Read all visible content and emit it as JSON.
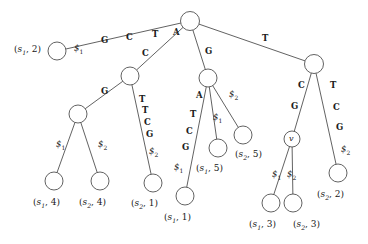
{
  "figure": {
    "type": "generalized-suffix-tree-diagram",
    "width": 368,
    "height": 244,
    "background": "#ffffff",
    "ink_color": "#3a3a3a",
    "text_color": "#202020"
  },
  "nodes": [
    {
      "id": "root",
      "name": "root-node",
      "cx": 190,
      "cy": 21,
      "r": 9.5,
      "label": ""
    },
    {
      "id": "n_s12",
      "name": "leaf-s1-2",
      "cx": 57,
      "cy": 51,
      "r": 9.0,
      "label": ""
    },
    {
      "id": "n_C",
      "name": "internal-node-c",
      "cx": 130,
      "cy": 76,
      "r": 9.0,
      "label": ""
    },
    {
      "id": "n_G",
      "name": "internal-node-g",
      "cx": 208,
      "cy": 78,
      "r": 9.0,
      "label": ""
    },
    {
      "id": "n_T",
      "name": "internal-node-t",
      "cx": 314,
      "cy": 64,
      "r": 9.5,
      "label": ""
    },
    {
      "id": "n_GG",
      "name": "internal-node-gg",
      "cx": 78,
      "cy": 114,
      "r": 9.0,
      "label": ""
    },
    {
      "id": "n_v",
      "name": "internal-node-v",
      "cx": 292,
      "cy": 139,
      "r": 8.0,
      "label": "v"
    },
    {
      "id": "l_s14",
      "name": "leaf-s1-4",
      "cx": 54,
      "cy": 181,
      "r": 9.0,
      "label": ""
    },
    {
      "id": "l_s24",
      "name": "leaf-s2-4",
      "cx": 100,
      "cy": 181,
      "r": 9.0,
      "label": ""
    },
    {
      "id": "l_s21",
      "name": "leaf-s2-1",
      "cx": 153,
      "cy": 183,
      "r": 9.0,
      "label": ""
    },
    {
      "id": "l_s11",
      "name": "leaf-s1-1",
      "cx": 185,
      "cy": 196,
      "r": 9.0,
      "label": ""
    },
    {
      "id": "l_s15",
      "name": "leaf-s1-5",
      "cx": 218,
      "cy": 148,
      "r": 9.0,
      "label": ""
    },
    {
      "id": "l_s25",
      "name": "leaf-s2-5",
      "cx": 243,
      "cy": 135,
      "r": 9.0,
      "label": ""
    },
    {
      "id": "l_s13",
      "name": "leaf-s1-3",
      "cx": 271,
      "cy": 203,
      "r": 9.0,
      "label": ""
    },
    {
      "id": "l_s23",
      "name": "leaf-s2-3",
      "cx": 293,
      "cy": 203,
      "r": 9.0,
      "label": ""
    },
    {
      "id": "l_s22",
      "name": "leaf-s2-2",
      "cx": 338,
      "cy": 173,
      "r": 9.0,
      "label": ""
    }
  ],
  "edges": [
    {
      "id": "e1",
      "name": "edge-root-to-s1-2",
      "from": "root",
      "to": "n_s12",
      "string": "$1 G C T A"
    },
    {
      "id": "e2",
      "name": "edge-root-to-c",
      "from": "root",
      "to": "n_C",
      "string": "C"
    },
    {
      "id": "e3",
      "name": "edge-root-to-g",
      "from": "root",
      "to": "n_G",
      "string": "G"
    },
    {
      "id": "e4",
      "name": "edge-root-to-t",
      "from": "root",
      "to": "n_T",
      "string": "T"
    },
    {
      "id": "e5",
      "name": "edge-c-to-gg",
      "from": "n_C",
      "to": "n_GG",
      "string": "G"
    },
    {
      "id": "e6",
      "name": "edge-c-to-s2-1",
      "from": "n_C",
      "to": "l_s21",
      "string": "T T C G $2"
    },
    {
      "id": "e7",
      "name": "edge-gg-to-s1-4",
      "from": "n_GG",
      "to": "l_s14",
      "string": "$1"
    },
    {
      "id": "e8",
      "name": "edge-gg-to-s2-4",
      "from": "n_GG",
      "to": "l_s24",
      "string": "$2"
    },
    {
      "id": "e9",
      "name": "edge-g-to-s1-1",
      "from": "n_G",
      "to": "l_s11",
      "string": "A T C G $1"
    },
    {
      "id": "e10",
      "name": "edge-g-to-s1-5",
      "from": "n_G",
      "to": "l_s15",
      "string": "$1"
    },
    {
      "id": "e11",
      "name": "edge-g-to-s2-5",
      "from": "n_G",
      "to": "l_s25",
      "string": "$2"
    },
    {
      "id": "e12",
      "name": "edge-t-to-v",
      "from": "n_T",
      "to": "n_v",
      "string": "C G"
    },
    {
      "id": "e13",
      "name": "edge-t-to-s2-2",
      "from": "n_T",
      "to": "l_s22",
      "string": "T C G $2"
    },
    {
      "id": "e14",
      "name": "edge-v-to-s1-3",
      "from": "n_v",
      "to": "l_s13",
      "string": "$1"
    },
    {
      "id": "e15",
      "name": "edge-v-to-s2-3",
      "from": "n_v",
      "to": "l_s23",
      "string": "$2"
    }
  ],
  "edge_labels": [
    {
      "name": "edge-label-dollar1-root-s12",
      "kind": "term",
      "text": "$",
      "subscript": "1",
      "x": 74,
      "y": 44
    },
    {
      "name": "edge-label-g-root-s12",
      "kind": "char",
      "text": "G",
      "x": 101,
      "y": 36
    },
    {
      "name": "edge-label-c-root-s12",
      "kind": "char",
      "text": "C",
      "x": 126,
      "y": 33
    },
    {
      "name": "edge-label-t-root-s12",
      "kind": "char",
      "text": "T",
      "x": 152,
      "y": 30
    },
    {
      "name": "edge-label-a-root-s12",
      "kind": "char",
      "text": "A",
      "x": 173,
      "y": 28
    },
    {
      "name": "edge-label-c-root-c",
      "kind": "char",
      "text": "C",
      "x": 142,
      "y": 49
    },
    {
      "name": "edge-label-g-root-g",
      "kind": "char",
      "text": "G",
      "x": 205,
      "y": 47
    },
    {
      "name": "edge-label-t-root-t",
      "kind": "char",
      "text": "T",
      "x": 262,
      "y": 34
    },
    {
      "name": "edge-label-g-c-gg",
      "kind": "char",
      "text": "G",
      "x": 101,
      "y": 87
    },
    {
      "name": "edge-label-t1-c-s21",
      "kind": "char",
      "text": "T",
      "x": 139,
      "y": 95
    },
    {
      "name": "edge-label-t2-c-s21",
      "kind": "char",
      "text": "T",
      "x": 142,
      "y": 106
    },
    {
      "name": "edge-label-c-c-s21",
      "kind": "char",
      "text": "C",
      "x": 144,
      "y": 118
    },
    {
      "name": "edge-label-g-c-s21",
      "kind": "char",
      "text": "G",
      "x": 146,
      "y": 130
    },
    {
      "name": "edge-label-dollar2-c-s21",
      "kind": "term",
      "text": "$",
      "subscript": "2",
      "x": 149,
      "y": 147
    },
    {
      "name": "edge-label-dollar1-gg-s14",
      "kind": "term",
      "text": "$",
      "subscript": "1",
      "x": 56,
      "y": 140
    },
    {
      "name": "edge-label-dollar2-gg-s24",
      "kind": "term",
      "text": "$",
      "subscript": "2",
      "x": 98,
      "y": 140
    },
    {
      "name": "edge-label-a-g-s11",
      "kind": "char",
      "text": "A",
      "x": 196,
      "y": 91
    },
    {
      "name": "edge-label-t-g-s11",
      "kind": "char",
      "text": "T",
      "x": 190,
      "y": 110
    },
    {
      "name": "edge-label-c-g-s11",
      "kind": "char",
      "text": "C",
      "x": 186,
      "y": 127
    },
    {
      "name": "edge-label-g-g-s11",
      "kind": "char",
      "text": "G",
      "x": 182,
      "y": 143
    },
    {
      "name": "edge-label-dollar1-g-s11",
      "kind": "term",
      "text": "$",
      "subscript": "1",
      "x": 174,
      "y": 163
    },
    {
      "name": "edge-label-dollar1-g-s15",
      "kind": "term",
      "text": "$",
      "subscript": "1",
      "x": 213,
      "y": 113
    },
    {
      "name": "edge-label-dollar2-g-s25",
      "kind": "term",
      "text": "$",
      "subscript": "2",
      "x": 229,
      "y": 90
    },
    {
      "name": "edge-label-c-t-v",
      "kind": "char",
      "text": "C",
      "x": 298,
      "y": 81
    },
    {
      "name": "edge-label-g-t-v",
      "kind": "char",
      "text": "G",
      "x": 291,
      "y": 102
    },
    {
      "name": "edge-label-t-t-s22",
      "kind": "char",
      "text": "T",
      "x": 330,
      "y": 81
    },
    {
      "name": "edge-label-c-t-s22",
      "kind": "char",
      "text": "C",
      "x": 333,
      "y": 103
    },
    {
      "name": "edge-label-g-t-s22",
      "kind": "char",
      "text": "G",
      "x": 336,
      "y": 123
    },
    {
      "name": "edge-label-dollar2-t-s22",
      "kind": "term",
      "text": "$",
      "subscript": "2",
      "x": 341,
      "y": 145
    },
    {
      "name": "edge-label-dollar1-v-s13",
      "kind": "term",
      "text": "$",
      "subscript": "1",
      "x": 272,
      "y": 170
    },
    {
      "name": "edge-label-dollar2-v-s23",
      "kind": "term",
      "text": "$",
      "subscript": "2",
      "x": 287,
      "y": 170
    }
  ],
  "leaf_labels": [
    {
      "name": "leaf-label-s1-2",
      "string": "s",
      "subscript": "1",
      "index": "2",
      "x": 14,
      "y": 45
    },
    {
      "name": "leaf-label-s1-4",
      "string": "s",
      "subscript": "1",
      "index": "4",
      "x": 33,
      "y": 198
    },
    {
      "name": "leaf-label-s2-4",
      "string": "s",
      "subscript": "2",
      "index": "4",
      "x": 79,
      "y": 198
    },
    {
      "name": "leaf-label-s2-1",
      "string": "s",
      "subscript": "2",
      "index": "1",
      "x": 131,
      "y": 199
    },
    {
      "name": "leaf-label-s1-1",
      "string": "s",
      "subscript": "1",
      "index": "1",
      "x": 164,
      "y": 213
    },
    {
      "name": "leaf-label-s1-5",
      "string": "s",
      "subscript": "1",
      "index": "5",
      "x": 196,
      "y": 164
    },
    {
      "name": "leaf-label-s2-5",
      "string": "s",
      "subscript": "2",
      "index": "5",
      "x": 235,
      "y": 150
    },
    {
      "name": "leaf-label-s1-3",
      "string": "s",
      "subscript": "1",
      "index": "3",
      "x": 249,
      "y": 220
    },
    {
      "name": "leaf-label-s2-3",
      "string": "s",
      "subscript": "2",
      "index": "3",
      "x": 293,
      "y": 220
    },
    {
      "name": "leaf-label-s2-2",
      "string": "s",
      "subscript": "2",
      "index": "2",
      "x": 317,
      "y": 190
    }
  ],
  "node_names": [
    {
      "name": "node-name-v",
      "text": "v",
      "x": 289,
      "y": 135
    }
  ]
}
